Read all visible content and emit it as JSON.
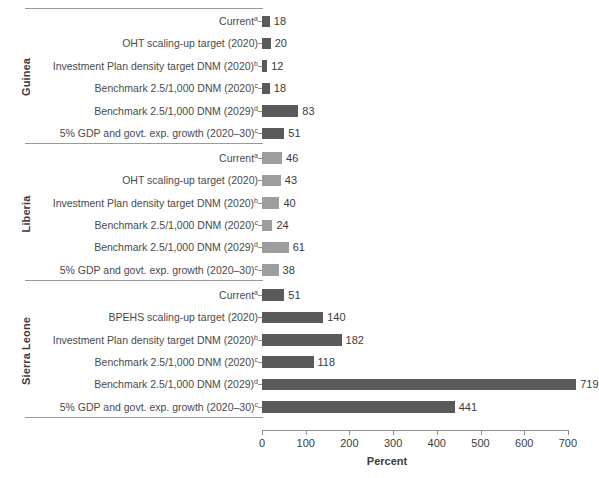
{
  "chart_data": {
    "type": "bar",
    "orientation": "horizontal",
    "title": "",
    "xlabel": "Percent",
    "ylabel": "",
    "xlim": [
      0,
      760
    ],
    "xticks": [
      0,
      100,
      200,
      300,
      400,
      500,
      600,
      700
    ],
    "grid": false,
    "legend": "none",
    "groups": [
      {
        "name": "Guinea",
        "color": "#5a5a5a",
        "categories": [
          "Currentᵃ",
          "OHT scaling-up target (2020)",
          "Investment Plan density target DNM (2020)ᵇ",
          "Benchmark 2.5/1,000 DNM (2020)ᶜ",
          "Benchmark  2.5/1,000 DNM (2029)ᵈ",
          "5% GDP and govt. exp. growth (2020–30)ᶜ"
        ],
        "values": [
          18,
          20,
          12,
          18,
          83,
          51
        ]
      },
      {
        "name": "Liberia",
        "color": "#9d9d9d",
        "categories": [
          "Currentᵃ",
          "OHT scaling-up target (2020)",
          "Investment Plan density target DNM (2020)ᵇ",
          "Benchmark 2.5/1,000 DNM (2020)ᶜ",
          "Benchmark  2.5/1,000 DNM (2029)ᵈ",
          "5% GDP and govt. exp. growth (2020–30)ᶜ"
        ],
        "values": [
          46,
          43,
          40,
          24,
          61,
          38
        ]
      },
      {
        "name": "Sierra Leone",
        "color": "#5a5a5a",
        "categories": [
          "Currentᵃ",
          "BPEHS scaling-up target (2020)",
          "Investment Plan density target DNM (2020)ᵇ",
          "Benchmark 2.5/1,000 DNM (2020)ᶜ",
          "Benchmark  2.5/1,000 DNM (2029)ᵈ",
          "5% GDP and govt. exp. growth (2020–30)ᶜ"
        ],
        "values": [
          51,
          140,
          182,
          118,
          719,
          441
        ]
      }
    ]
  },
  "groups": [
    {
      "label": "Guinea",
      "shade": "dark",
      "rows": [
        {
          "label": "Current",
          "sup": "a",
          "value": 18
        },
        {
          "label": "OHT scaling-up target (2020)",
          "sup": "",
          "value": 20
        },
        {
          "label": "Investment Plan density target DNM (2020)",
          "sup": "b",
          "value": 12
        },
        {
          "label": "Benchmark 2.5/1,000 DNM (2020)",
          "sup": "c",
          "value": 18
        },
        {
          "label": "Benchmark  2.5/1,000 DNM (2029)",
          "sup": "d",
          "value": 83
        },
        {
          "label": "5% GDP and govt. exp. growth (2020–30)",
          "sup": "c",
          "value": 51
        }
      ]
    },
    {
      "label": "Liberia",
      "shade": "light",
      "rows": [
        {
          "label": "Current",
          "sup": "a",
          "value": 46
        },
        {
          "label": "OHT scaling-up target (2020)",
          "sup": "",
          "value": 43
        },
        {
          "label": "Investment Plan density target DNM (2020)",
          "sup": "b",
          "value": 40
        },
        {
          "label": "Benchmark 2.5/1,000 DNM (2020)",
          "sup": "c",
          "value": 24
        },
        {
          "label": "Benchmark  2.5/1,000 DNM (2029)",
          "sup": "d",
          "value": 61
        },
        {
          "label": "5% GDP and govt. exp. growth (2020–30)",
          "sup": "c",
          "value": 38
        }
      ]
    },
    {
      "label": "Sierra Leone",
      "shade": "dark",
      "rows": [
        {
          "label": "Current",
          "sup": "a",
          "value": 51
        },
        {
          "label": "BPEHS scaling-up target (2020)",
          "sup": "",
          "value": 140
        },
        {
          "label": "Investment Plan density target DNM (2020)",
          "sup": "b",
          "value": 182
        },
        {
          "label": "Benchmark 2.5/1,000 DNM (2020)",
          "sup": "c",
          "value": 118
        },
        {
          "label": "Benchmark  2.5/1,000 DNM (2029)",
          "sup": "d",
          "value": 719
        },
        {
          "label": "5% GDP and govt. exp. growth (2020–30)",
          "sup": "c",
          "value": 441
        }
      ]
    }
  ],
  "axis": {
    "title": "Percent",
    "ticks": [
      "0",
      "100",
      "200",
      "300",
      "400",
      "500",
      "600",
      "700"
    ]
  },
  "colors": {
    "bar_dark": "#5a5a5a",
    "bar_light": "#9d9d9d",
    "axis": "#8d8d8d",
    "text": "#3b3b3b"
  }
}
